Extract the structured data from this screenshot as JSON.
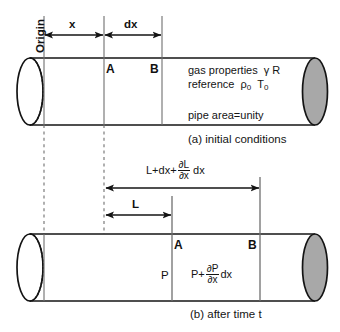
{
  "figure": {
    "panels": [
      {
        "id": "a",
        "caption": "(a) initial conditions",
        "annotations": {
          "origin": "Origin",
          "dim_x": "x",
          "dim_dx": "dx",
          "station_left": "A",
          "station_right": "B",
          "gas_properties_line": "gas properties",
          "gas_properties_symbols": "γ R",
          "reference_line": "reference",
          "reference_rho": "ρ",
          "reference_rho_sub": "0",
          "reference_T": "T",
          "reference_T_sub": "0",
          "pipe_area": "pipe area=unity"
        }
      },
      {
        "id": "b",
        "caption": "(b) after time t",
        "annotations": {
          "dim_L": "L",
          "long_dim_prefix": "L+dx+",
          "long_dim_frac_num": "∂L",
          "long_dim_frac_den": "∂x",
          "long_dim_suffix": "dx",
          "station_left": "A",
          "station_right": "B",
          "pressure_left": "P",
          "pressure_right_prefix": "P+",
          "pressure_right_frac_num": "∂P",
          "pressure_right_frac_den": "∂x",
          "pressure_right_suffix": "dx"
        }
      }
    ],
    "colors": {
      "stroke": "#141414",
      "end_cap_fill": "#a8a8a8",
      "pipe_fill": "#ffffff",
      "dashed": "#6f6f6f",
      "text": "#141414"
    }
  }
}
